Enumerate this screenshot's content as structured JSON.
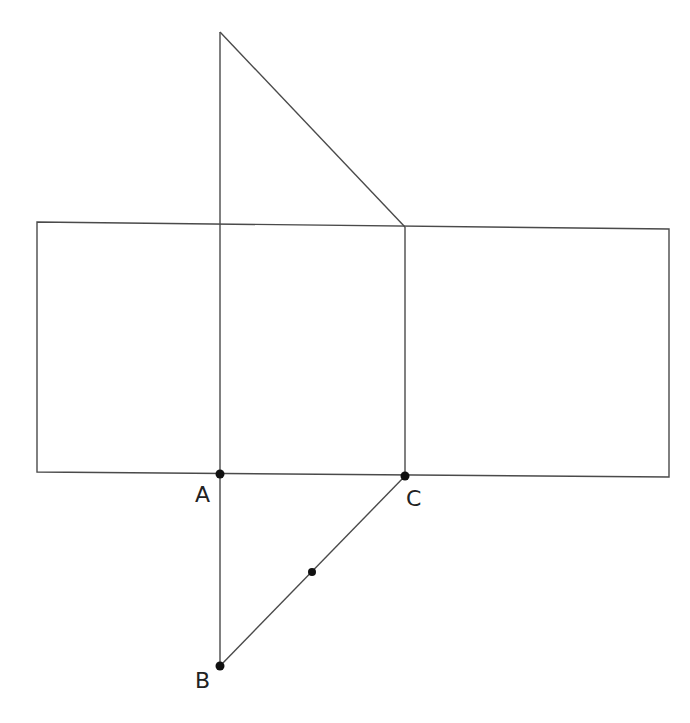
{
  "diagram": {
    "labels": {
      "A": "A",
      "B": "B",
      "C": "C"
    },
    "points": [
      "A",
      "B",
      "C",
      "midpoint-BC"
    ],
    "colors": {
      "line": "#4a4a4a",
      "point": "#111111",
      "label": "#222222"
    }
  }
}
